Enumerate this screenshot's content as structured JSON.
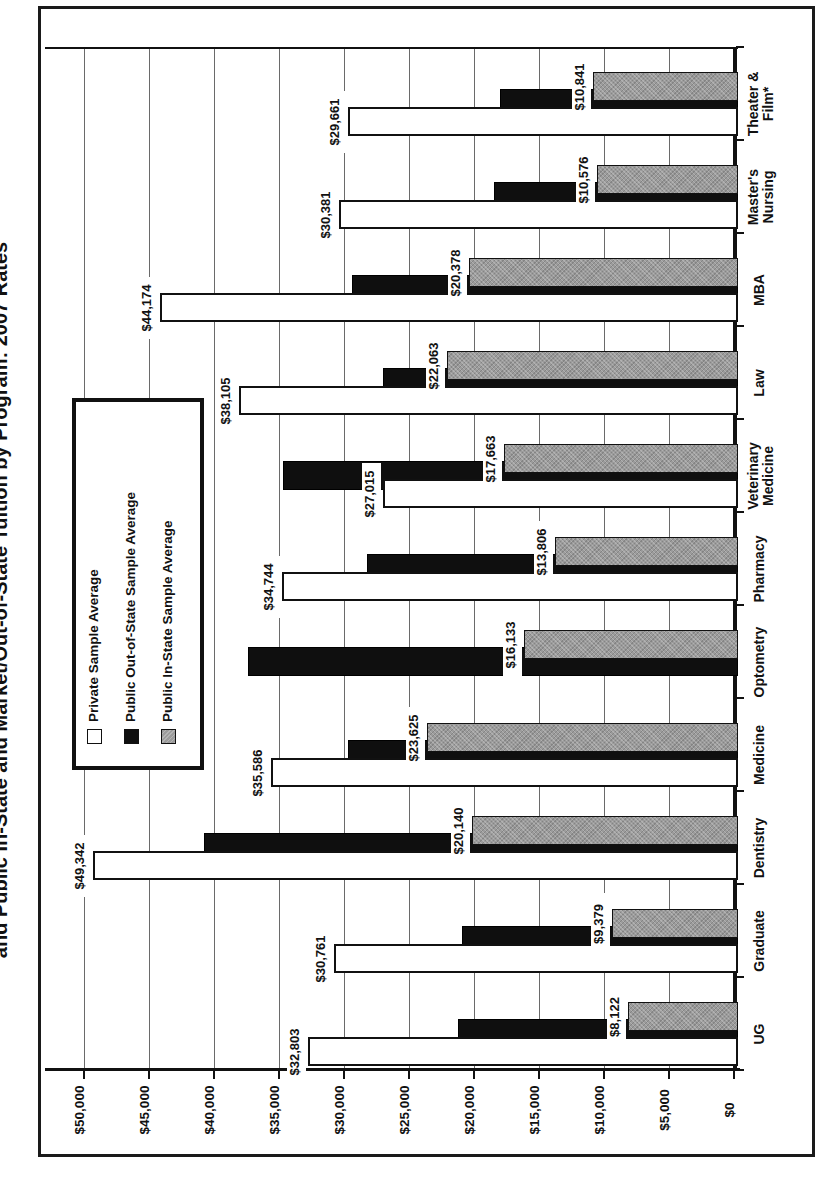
{
  "page": {
    "kind": "scanned chart page",
    "title_fragment": "and Public In-State and Market/Out-of-State Tuition by Program: 2007 Rates"
  },
  "legend": {
    "items": [
      {
        "label": "Private Sample Average",
        "color": "#ffffff"
      },
      {
        "label": "Public Out-of-State Sample Average",
        "color": "#0f0f0f"
      },
      {
        "label": "Public In-State Sample Average",
        "color": "#9b9b9b"
      }
    ]
  },
  "chart_data": {
    "type": "bar",
    "title": "and Public In-State and Market/Out-of-State Tuition by Program: 2007 Rates",
    "orientation": "landscape chart rotated 90deg CCW on portrait page",
    "grid": true,
    "legend_position": "inside plot, upper-left of landscape chart",
    "value_axis": {
      "min": 0,
      "max": 52500,
      "tick_interval": 5000,
      "tick_labels": [
        "$0",
        "$5,000",
        "$10,000",
        "$15,000",
        "$20,000",
        "$25,000",
        "$30,000",
        "$35,000",
        "$40,000",
        "$45,000",
        "$50,000"
      ]
    },
    "categories": [
      "UG",
      "Graduate",
      "Dentistry",
      "Medicine",
      "Optometry",
      "Pharmacy",
      "Veterinary Medicine",
      "Law",
      "MBA",
      "Master's Nursing",
      "Theater & Film*"
    ],
    "category_display_lines": [
      [
        "UG"
      ],
      [
        "Graduate"
      ],
      [
        "Dentistry"
      ],
      [
        "Medicine"
      ],
      [
        "Optometry"
      ],
      [
        "Pharmacy"
      ],
      [
        "Veterinary",
        "Medicine"
      ],
      [
        "Law"
      ],
      [
        "MBA"
      ],
      [
        "Master's",
        "Nursing"
      ],
      [
        "Theater &",
        "Film*"
      ]
    ],
    "series": [
      {
        "name": "Private Sample Average",
        "role": "private",
        "color": "#ffffff",
        "labels_shown": true,
        "values": [
          32803,
          30761,
          49342,
          35586,
          null,
          34744,
          27015,
          38105,
          44174,
          30381,
          29661
        ]
      },
      {
        "name": "Public Out-of-State Sample Average",
        "role": "outstate",
        "color": "#0f0f0f",
        "labels_shown": false,
        "estimated": true,
        "values": [
          21200,
          20900,
          40800,
          29700,
          37400,
          28200,
          34700,
          27000,
          29400,
          18500,
          18000
        ]
      },
      {
        "name": "Public In-State Sample Average",
        "role": "instate",
        "color": "#9b9b9b",
        "labels_shown": true,
        "values": [
          8122,
          9379,
          20140,
          23625,
          16133,
          13806,
          17663,
          22063,
          20378,
          10576,
          10841
        ]
      }
    ]
  }
}
